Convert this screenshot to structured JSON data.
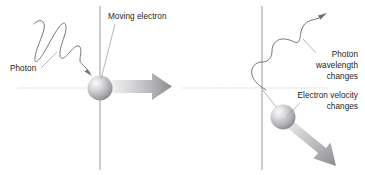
{
  "figure": {
    "width": 365,
    "height": 175,
    "background": "#ffffff"
  },
  "colors": {
    "text": "#1d1d1d",
    "axis": "#8e8e92",
    "dotted_axis": "#b9b9bd",
    "leader": "#9a9a9e",
    "wave": "#6f6f74",
    "arrow_light": "#e4e4e6",
    "arrow_dark": "#8a8a8e",
    "sphere_light": "#f2f2f2",
    "sphere_dark": "#8d8d91"
  },
  "panels": [
    {
      "name": "before-collision",
      "labels": [
        {
          "id": "moving-electron",
          "text": "Moving electron"
        },
        {
          "id": "photon",
          "text": "Photon"
        }
      ],
      "elements": {
        "incoming_photon_wave": "short-wavelength-zigzag",
        "electron": "stationary-electron-sphere",
        "electron_momentum_arrow": "horizontal-right-arrow",
        "vertical_axis": "electron-path-axis",
        "horizontal_axis": "photon-path-dotted-axis"
      }
    },
    {
      "name": "after-collision",
      "labels": [
        {
          "id": "photon-wavelength-changes",
          "lines": [
            "Photon",
            "wavelength",
            "changes"
          ]
        },
        {
          "id": "electron-velocity-changes",
          "lines": [
            "Electron velocity",
            "changes"
          ]
        }
      ],
      "elements": {
        "scattered_photon_wave": "long-wavelength-sine",
        "electron": "recoiling-electron-sphere",
        "electron_momentum_arrow": "diagonal-down-right-arrow",
        "vertical_axis": "electron-path-axis",
        "horizontal_axis": "photon-path-dotted-axis"
      }
    }
  ],
  "text": {
    "moving_electron": "Moving electron",
    "photon": "Photon",
    "photon_wavelength_1": "Photon",
    "photon_wavelength_2": "wavelength",
    "photon_wavelength_3": "changes",
    "electron_velocity_1": "Electron velocity",
    "electron_velocity_2": "changes"
  }
}
